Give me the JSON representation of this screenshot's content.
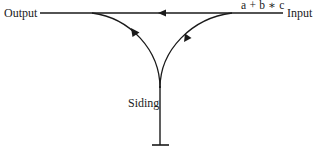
{
  "diagram": {
    "type": "shunting-yard railway",
    "labels": {
      "output": "Output",
      "input": "Input",
      "expression": "a + b ∗ c",
      "siding": "Siding"
    },
    "tracks": [
      {
        "name": "main-line",
        "direction": "right-to-left",
        "from": "Input",
        "to": "Output"
      },
      {
        "name": "input-to-siding-curve",
        "direction": "into siding",
        "from": "Input",
        "to": "Siding"
      },
      {
        "name": "siding-to-output-curve",
        "direction": "out of siding",
        "from": "Siding",
        "to": "Output"
      },
      {
        "name": "siding-stem",
        "end": "buffer-stop"
      }
    ],
    "colors": {
      "line": "#1a1a1a",
      "background": "#ffffff"
    }
  }
}
